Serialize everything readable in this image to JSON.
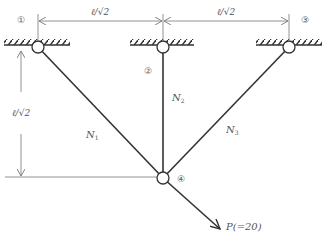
{
  "diagram": {
    "type": "truss-structure",
    "nodes": [
      {
        "id": "1",
        "label": "①",
        "x": 38,
        "y": 47,
        "support": "pin"
      },
      {
        "id": "2",
        "label": "②",
        "x": 163,
        "y": 47,
        "support": "pin"
      },
      {
        "id": "3",
        "label": "③",
        "x": 289,
        "y": 47,
        "support": "pin"
      },
      {
        "id": "4",
        "label": "④",
        "x": 163,
        "y": 178,
        "support": "free"
      }
    ],
    "members": [
      {
        "name": "N",
        "subscript": "1",
        "from": "1",
        "to": "4"
      },
      {
        "name": "N",
        "subscript": "2",
        "from": "2",
        "to": "4"
      },
      {
        "name": "N",
        "subscript": "3",
        "from": "3",
        "to": "4"
      }
    ],
    "dimensions": {
      "top_left": "ℓ/√2",
      "top_right": "ℓ/√2",
      "left_vertical": "ℓ/√2"
    },
    "load": {
      "label": "P(=20)",
      "at_node": "4",
      "direction": "down-right 45°"
    },
    "colors": {
      "line": "#333333",
      "dim_line": "#777777",
      "text": "#555555"
    }
  }
}
